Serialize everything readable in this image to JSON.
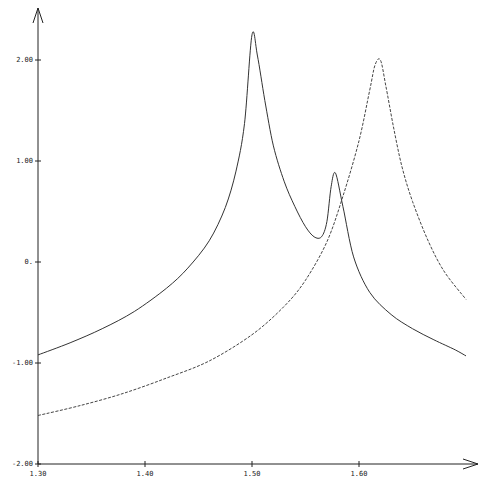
{
  "chart_data": {
    "type": "line",
    "title": "",
    "xlabel": "",
    "ylabel": "",
    "xlim": [
      1.3,
      1.72
    ],
    "ylim": [
      -2.0,
      2.3
    ],
    "grid": false,
    "legend": null,
    "x_ticks": [
      {
        "value": 1.3,
        "label": "1.30"
      },
      {
        "value": 1.4,
        "label": "1.40"
      },
      {
        "value": 1.5,
        "label": "1.50"
      },
      {
        "value": 1.6,
        "label": "1.60"
      }
    ],
    "y_ticks": [
      {
        "value": 2.0,
        "label": "2.00"
      },
      {
        "value": 1.0,
        "label": "1.00"
      },
      {
        "value": 0.0,
        "label": "0."
      },
      {
        "value": -1.0,
        "label": "-1.00"
      },
      {
        "value": -2.0,
        "label": "-2.00"
      }
    ],
    "series": [
      {
        "name": "solid",
        "style": "solid",
        "color": "#333333",
        "x": [
          1.3,
          1.33,
          1.36,
          1.39,
          1.42,
          1.44,
          1.46,
          1.475,
          1.485,
          1.493,
          1.5,
          1.505,
          1.512,
          1.52,
          1.53,
          1.54,
          1.55,
          1.558,
          1.565,
          1.57,
          1.574,
          1.578,
          1.585,
          1.595,
          1.61,
          1.63,
          1.65,
          1.67,
          1.69,
          1.7
        ],
        "y": [
          -0.92,
          -0.8,
          -0.66,
          -0.49,
          -0.26,
          -0.06,
          0.21,
          0.54,
          0.9,
          1.37,
          2.25,
          2.05,
          1.6,
          1.15,
          0.8,
          0.55,
          0.35,
          0.25,
          0.25,
          0.4,
          0.75,
          0.88,
          0.55,
          0.05,
          -0.3,
          -0.52,
          -0.66,
          -0.77,
          -0.87,
          -0.93
        ]
      },
      {
        "name": "dashed",
        "style": "dashed",
        "color": "#444444",
        "x": [
          1.3,
          1.34,
          1.38,
          1.42,
          1.46,
          1.5,
          1.53,
          1.55,
          1.57,
          1.585,
          1.6,
          1.61,
          1.615,
          1.62,
          1.625,
          1.632,
          1.64,
          1.65,
          1.665,
          1.68,
          1.7
        ],
        "y": [
          -1.52,
          -1.42,
          -1.3,
          -1.15,
          -0.98,
          -0.72,
          -0.44,
          -0.18,
          0.2,
          0.65,
          1.2,
          1.7,
          1.95,
          2.0,
          1.75,
          1.35,
          0.95,
          0.6,
          0.2,
          -0.1,
          -0.37
        ]
      }
    ]
  },
  "axes": {
    "x_origin_label": "1.30"
  }
}
